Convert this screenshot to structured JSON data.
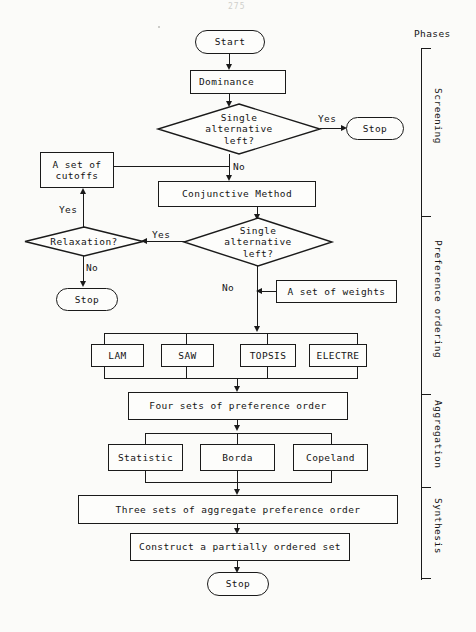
{
  "page": {
    "page_number": "275"
  },
  "phases": {
    "header_label": "Phases",
    "items": [
      {
        "label": "Screening"
      },
      {
        "label": "Preference ordering"
      },
      {
        "label": "Aggregation"
      },
      {
        "label": "Synthesis"
      }
    ]
  },
  "nodes": {
    "start": "Start",
    "dominance": "Dominance",
    "decision1": "Single\nalternative\nleft?",
    "stop_right": "Stop",
    "cutoffs": "A set of\ncutoffs",
    "conjunctive": "Conjunctive Method",
    "relaxation": "Relaxation?",
    "decision2": "Single\nalternative\nleft?",
    "stop_left": "Stop",
    "weights": "A set of weights",
    "lam": "LAM",
    "saw": "SAW",
    "topsis": "TOPSIS",
    "electre": "ELECTRE",
    "four_sets": "Four sets of preference order",
    "statistic": "Statistic",
    "borda": "Borda",
    "copeland": "Copeland",
    "three_sets": "Three sets of aggregate preference order",
    "construct": "Construct a partially ordered set",
    "stop_end": "Stop"
  },
  "edge_labels": {
    "d1_yes": "Yes",
    "d1_no": "No",
    "relax_yes": "Yes",
    "relax_no": "No",
    "d2_yes": "Yes",
    "d2_no": "No"
  },
  "colors": {
    "ink": "#1a1a1a",
    "paper": "#fbfbf9"
  }
}
